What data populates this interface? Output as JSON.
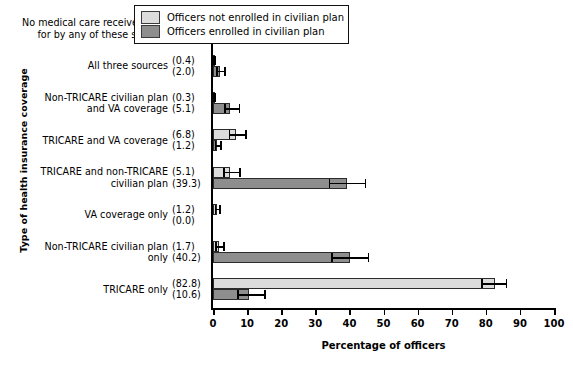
{
  "chart_data": {
    "type": "bar",
    "orientation": "horizontal",
    "title": "",
    "xlabel": "Percentage of officers",
    "ylabel": "Type of health insurance coverage",
    "xlim": [
      0,
      100
    ],
    "xticks": [
      0,
      10,
      20,
      30,
      40,
      50,
      60,
      70,
      80,
      90,
      100
    ],
    "grid": false,
    "legend_position": "top-right",
    "categories": [
      "No medical care received/paid for by any of these sources",
      "All three sources",
      "Non-TRICARE civilian plan and VA coverage",
      "TRICARE and VA coverage",
      "TRICARE and non-TRICARE civilian plan",
      "VA coverage only",
      "Non-TRICARE civilian plan only",
      "TRICARE only"
    ],
    "category_lines": [
      [
        "No medical care received/paid",
        "for by any of these sources"
      ],
      [
        "All three sources"
      ],
      [
        "Non-TRICARE civilian plan",
        "and VA coverage"
      ],
      [
        "TRICARE and VA coverage"
      ],
      [
        "TRICARE and non-TRICARE",
        "civilian plan"
      ],
      [
        "VA coverage only"
      ],
      [
        "Non-TRICARE civilian plan",
        "only"
      ],
      [
        "TRICARE only"
      ]
    ],
    "series": [
      {
        "name": "Officers not enrolled in civilian plan",
        "color": "#dcdcdc",
        "values": [
          1.8,
          0.4,
          0.3,
          6.8,
          5.1,
          1.2,
          1.7,
          82.8
        ],
        "value_labels": [
          "(1.8)",
          "(0.4)",
          "(0.3)",
          "(6.8)",
          "(5.1)",
          "(1.2)",
          "(1.7)",
          "(82.8)"
        ],
        "error_low": [
          0.9,
          0.1,
          0.1,
          4.6,
          3.0,
          0.5,
          0.7,
          78.6
        ],
        "error_high": [
          3.1,
          1.0,
          0.8,
          10.0,
          8.1,
          2.3,
          3.4,
          86.3
        ]
      },
      {
        "name": "Officers enrolled in civilian plan",
        "color": "#8e8e8e",
        "values": [
          1.6,
          2.0,
          5.1,
          1.2,
          39.3,
          0.0,
          40.2,
          10.6
        ],
        "value_labels": [
          "(1.6)",
          "(2.0)",
          "(5.1)",
          "(1.2)",
          "(39.3)",
          "(0.0)",
          "(40.2)",
          "(10.6)"
        ],
        "error_low": [
          0.8,
          1.0,
          3.2,
          0.5,
          33.9,
          0.0,
          34.7,
          7.1
        ],
        "error_high": [
          3.3,
          3.8,
          8.0,
          2.6,
          44.9,
          0.0,
          45.8,
          15.4
        ]
      }
    ]
  },
  "legend": {
    "entries": [
      {
        "label": "Officers not enrolled in civilian plan",
        "swatch": "light"
      },
      {
        "label": "Officers enrolled in civilian plan",
        "swatch": "dark"
      }
    ]
  }
}
